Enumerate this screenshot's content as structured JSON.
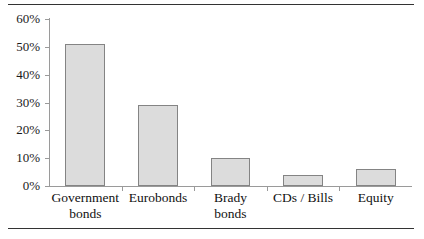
{
  "figure": {
    "background_color": "#ffffff",
    "rule_color": "#333333",
    "axis_color": "#9a9a9a"
  },
  "chart_data": {
    "type": "bar",
    "title": "",
    "subtitle": "",
    "xlabel": "",
    "ylabel": "",
    "categories": [
      "Government\nbonds",
      "Eurobonds",
      "Brady\nbonds",
      "CDs / Bills",
      "Equity"
    ],
    "values": [
      51,
      29,
      10,
      4,
      6
    ],
    "value_unit": "%",
    "ylim": [
      0,
      60
    ],
    "ytick_values": [
      0,
      10,
      20,
      30,
      40,
      50,
      60
    ],
    "ytick_labels": [
      "0%",
      "10%",
      "20%",
      "30%",
      "40%",
      "50%",
      "60%"
    ],
    "grid": false,
    "legend": false,
    "legend_position": "none",
    "bar_fill_color": "#dcdcdc",
    "bar_border_color": "#848484",
    "annotations": []
  }
}
